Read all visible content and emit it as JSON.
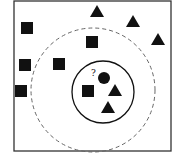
{
  "diagram": {
    "type": "knn-classification",
    "query_label": "?",
    "colors": {
      "shape": "#111111",
      "frame": "#333333",
      "dashed": "#666666",
      "background": "#ffffff"
    },
    "frame": {
      "x": 14,
      "y": 1,
      "w": 157,
      "h": 150
    },
    "outer_circle": {
      "cx": 93,
      "cy": 90,
      "r": 62,
      "style": "dashed"
    },
    "inner_circle": {
      "cx": 103,
      "cy": 92,
      "r": 31,
      "style": "solid"
    },
    "query_point": {
      "cx": 104,
      "cy": 78,
      "r": 6,
      "label_x": 91,
      "label_y": 76
    },
    "squares": [
      {
        "x": 27,
        "y": 28
      },
      {
        "x": 92,
        "y": 42
      },
      {
        "x": 25,
        "y": 65
      },
      {
        "x": 59,
        "y": 64
      },
      {
        "x": 21,
        "y": 91
      },
      {
        "x": 88,
        "y": 91
      }
    ],
    "triangles": [
      {
        "x": 97,
        "y": 12
      },
      {
        "x": 133,
        "y": 22
      },
      {
        "x": 158,
        "y": 40
      },
      {
        "x": 115,
        "y": 91
      },
      {
        "x": 108,
        "y": 108
      }
    ]
  }
}
